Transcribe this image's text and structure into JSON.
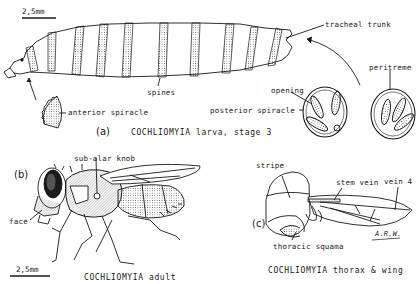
{
  "figure": {
    "panels": [
      {
        "id": "a",
        "letter": "(a)",
        "caption": "COCHLIOMYIA larva, stage 3",
        "scale_bar": "2,5mm",
        "labels": {
          "tracheal_trunk": "tracheal trunk",
          "peritreme": "peritreme",
          "opening": "opening",
          "spines": "spines",
          "anterior_spiracle": "anterior spiracle",
          "posterior_spiracle": "posterior spiracle"
        }
      },
      {
        "id": "b",
        "letter": "(b)",
        "caption": "COCHLIOMYIA adult",
        "scale_bar": "2,5mm",
        "labels": {
          "sub_alar_knob": "sub-alar knob",
          "face": "face"
        }
      },
      {
        "id": "c",
        "letter": "(c)",
        "caption": "COCHLIOMYIA thorax & wing",
        "labels": {
          "stripe": "stripe",
          "stem_vein": "stem vein",
          "vein_4": "vein 4",
          "thoracic_squama": "thoracic squama"
        },
        "signature": "A.R.W."
      }
    ]
  },
  "colors": {
    "ink": "#1a1a1a",
    "background": "#ffffff"
  }
}
